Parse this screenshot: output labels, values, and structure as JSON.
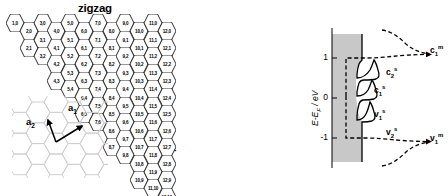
{
  "figure": {
    "left_panel": {
      "zigzag_label": "zigzag",
      "armchair_label": "armchair",
      "lattice_vectors": [
        {
          "name": "a1",
          "base": "a",
          "sub": "1"
        },
        {
          "name": "a2",
          "base": "a",
          "sub": "2"
        }
      ],
      "hexagons": [
        {
          "n": 1,
          "m": 0,
          "label": "1,0",
          "col": 1,
          "row": 0
        },
        {
          "n": 2,
          "m": 0,
          "label": "2,0",
          "col": 2,
          "row": 0
        },
        {
          "n": 3,
          "m": 0,
          "label": "3,0",
          "col": 3,
          "row": 0
        },
        {
          "n": 4,
          "m": 0,
          "label": "4,0",
          "col": 4,
          "row": 0
        },
        {
          "n": 5,
          "m": 0,
          "label": "5,0",
          "col": 5,
          "row": 0
        },
        {
          "n": 6,
          "m": 0,
          "label": "6,0",
          "col": 6,
          "row": 0
        },
        {
          "n": 7,
          "m": 0,
          "label": "7,0",
          "col": 7,
          "row": 0
        },
        {
          "n": 8,
          "m": 0,
          "label": "8,0",
          "col": 8,
          "row": 0
        },
        {
          "n": 9,
          "m": 0,
          "label": "9,0",
          "col": 9,
          "row": 0
        },
        {
          "n": 10,
          "m": 0,
          "label": "10,0",
          "col": 10,
          "row": 0
        },
        {
          "n": 11,
          "m": 0,
          "label": "11,0",
          "col": 11,
          "row": 0
        },
        {
          "n": 12,
          "m": 0,
          "label": "12,0",
          "col": 12,
          "row": 0
        },
        {
          "n": 2,
          "m": 1,
          "label": "2,1",
          "col": 2,
          "row": 1
        },
        {
          "n": 3,
          "m": 1,
          "label": "3,1",
          "col": 3,
          "row": 1
        },
        {
          "n": 4,
          "m": 1,
          "label": "4,1",
          "col": 4,
          "row": 1
        },
        {
          "n": 5,
          "m": 1,
          "label": "5,1",
          "col": 5,
          "row": 1
        },
        {
          "n": 6,
          "m": 1,
          "label": "6,1",
          "col": 6,
          "row": 1
        },
        {
          "n": 7,
          "m": 1,
          "label": "7,1",
          "col": 7,
          "row": 1
        },
        {
          "n": 8,
          "m": 1,
          "label": "8,1",
          "col": 8,
          "row": 1
        },
        {
          "n": 9,
          "m": 1,
          "label": "9,1",
          "col": 9,
          "row": 1
        },
        {
          "n": 10,
          "m": 1,
          "label": "10,1",
          "col": 10,
          "row": 1
        },
        {
          "n": 11,
          "m": 1,
          "label": "11,1",
          "col": 11,
          "row": 1
        },
        {
          "n": 12,
          "m": 1,
          "label": "12,1",
          "col": 12,
          "row": 1
        },
        {
          "n": 3,
          "m": 2,
          "label": "3,2",
          "col": 3,
          "row": 2
        },
        {
          "n": 4,
          "m": 2,
          "label": "4,2",
          "col": 4,
          "row": 2
        },
        {
          "n": 5,
          "m": 2,
          "label": "5,2",
          "col": 5,
          "row": 2
        },
        {
          "n": 6,
          "m": 2,
          "label": "6,2",
          "col": 6,
          "row": 2
        },
        {
          "n": 7,
          "m": 2,
          "label": "7,2",
          "col": 7,
          "row": 2
        },
        {
          "n": 8,
          "m": 2,
          "label": "8,2",
          "col": 8,
          "row": 2
        },
        {
          "n": 9,
          "m": 2,
          "label": "9,2",
          "col": 9,
          "row": 2
        },
        {
          "n": 10,
          "m": 2,
          "label": "10,2",
          "col": 10,
          "row": 2
        },
        {
          "n": 11,
          "m": 2,
          "label": "11,2",
          "col": 11,
          "row": 2
        },
        {
          "n": 12,
          "m": 2,
          "label": "12,2",
          "col": 12,
          "row": 2
        },
        {
          "n": 4,
          "m": 3,
          "label": "4,3",
          "col": 4,
          "row": 3
        },
        {
          "n": 5,
          "m": 3,
          "label": "5,3",
          "col": 5,
          "row": 3
        },
        {
          "n": 6,
          "m": 3,
          "label": "6,3",
          "col": 6,
          "row": 3
        },
        {
          "n": 7,
          "m": 3,
          "label": "7,3",
          "col": 7,
          "row": 3
        },
        {
          "n": 8,
          "m": 3,
          "label": "8,3",
          "col": 8,
          "row": 3
        },
        {
          "n": 9,
          "m": 3,
          "label": "9,3",
          "col": 9,
          "row": 3
        },
        {
          "n": 10,
          "m": 3,
          "label": "10,3",
          "col": 10,
          "row": 3
        },
        {
          "n": 11,
          "m": 3,
          "label": "11,3",
          "col": 11,
          "row": 3
        },
        {
          "n": 12,
          "m": 3,
          "label": "12,3",
          "col": 12,
          "row": 3
        },
        {
          "n": 5,
          "m": 4,
          "label": "5,4",
          "col": 5,
          "row": 4
        },
        {
          "n": 6,
          "m": 4,
          "label": "6,4",
          "col": 6,
          "row": 4
        },
        {
          "n": 7,
          "m": 4,
          "label": "7,4",
          "col": 7,
          "row": 4
        },
        {
          "n": 8,
          "m": 4,
          "label": "8,4",
          "col": 8,
          "row": 4
        },
        {
          "n": 9,
          "m": 4,
          "label": "9,4",
          "col": 9,
          "row": 4
        },
        {
          "n": 10,
          "m": 4,
          "label": "10,4",
          "col": 10,
          "row": 4
        },
        {
          "n": 11,
          "m": 4,
          "label": "11,4",
          "col": 11,
          "row": 4
        },
        {
          "n": 12,
          "m": 4,
          "label": "12,4",
          "col": 12,
          "row": 4
        },
        {
          "n": 6,
          "m": 5,
          "label": "6,5",
          "col": 6,
          "row": 5
        },
        {
          "n": 7,
          "m": 5,
          "label": "7,5",
          "col": 7,
          "row": 5
        },
        {
          "n": 8,
          "m": 5,
          "label": "8,5",
          "col": 8,
          "row": 5
        },
        {
          "n": 9,
          "m": 5,
          "label": "9,5",
          "col": 9,
          "row": 5
        },
        {
          "n": 10,
          "m": 5,
          "label": "10,5",
          "col": 10,
          "row": 5
        },
        {
          "n": 11,
          "m": 5,
          "label": "11,5",
          "col": 11,
          "row": 5
        },
        {
          "n": 12,
          "m": 5,
          "label": "12,5",
          "col": 12,
          "row": 5
        },
        {
          "n": 7,
          "m": 6,
          "label": "7,6",
          "col": 7,
          "row": 6
        },
        {
          "n": 8,
          "m": 6,
          "label": "8,6",
          "col": 8,
          "row": 6
        },
        {
          "n": 9,
          "m": 6,
          "label": "9,6",
          "col": 9,
          "row": 6
        },
        {
          "n": 10,
          "m": 6,
          "label": "10,6",
          "col": 10,
          "row": 6
        },
        {
          "n": 11,
          "m": 6,
          "label": "11,6",
          "col": 11,
          "row": 6
        },
        {
          "n": 12,
          "m": 6,
          "label": "12,6",
          "col": 12,
          "row": 6
        },
        {
          "n": 8,
          "m": 7,
          "label": "8,7",
          "col": 8,
          "row": 7
        },
        {
          "n": 9,
          "m": 7,
          "label": "9,7",
          "col": 9,
          "row": 7
        },
        {
          "n": 10,
          "m": 7,
          "label": "10,7",
          "col": 10,
          "row": 7
        },
        {
          "n": 11,
          "m": 7,
          "label": "11,7",
          "col": 11,
          "row": 7
        },
        {
          "n": 12,
          "m": 7,
          "label": "12,7",
          "col": 12,
          "row": 7
        },
        {
          "n": 9,
          "m": 8,
          "label": "9,8",
          "col": 9,
          "row": 8
        },
        {
          "n": 10,
          "m": 8,
          "label": "10,8",
          "col": 10,
          "row": 8
        },
        {
          "n": 11,
          "m": 8,
          "label": "11,8",
          "col": 11,
          "row": 8
        },
        {
          "n": 12,
          "m": 8,
          "label": "12,8",
          "col": 12,
          "row": 8
        },
        {
          "n": 10,
          "m": 9,
          "label": "10,9",
          "col": 10,
          "row": 9
        },
        {
          "n": 11,
          "m": 9,
          "label": "11,9",
          "col": 11,
          "row": 9
        },
        {
          "n": 12,
          "m": 9,
          "label": "12,9",
          "col": 12,
          "row": 9
        },
        {
          "n": 11,
          "m": 10,
          "label": "11,10",
          "col": 11,
          "row": 10
        },
        {
          "n": 12,
          "m": 10,
          "label": "12,10",
          "col": 12,
          "row": 10
        }
      ]
    },
    "right_panel": {
      "y_axis_title_main": "E-E",
      "y_axis_title_sub": "F",
      "y_axis_title_unit": " / eV",
      "y_ticks": [
        "1",
        "0",
        "-1"
      ],
      "peak_labels": [
        {
          "id": "c1m",
          "base": "c",
          "sub": "1",
          "sup": "m"
        },
        {
          "id": "c2s",
          "base": "c",
          "sub": "2",
          "sup": "s"
        },
        {
          "id": "c1s",
          "base": "c",
          "sub": "1",
          "sup": "s"
        },
        {
          "id": "v1s",
          "base": "v",
          "sub": "1",
          "sup": "s"
        },
        {
          "id": "v2s",
          "base": "v",
          "sub": "2",
          "sup": "s"
        },
        {
          "id": "v1m",
          "base": "v",
          "sub": "1",
          "sup": "m"
        }
      ]
    }
  },
  "chart_data": {
    "type": "line",
    "xlabel": "DOS (arb. units)",
    "ylabel": "E-E_F / eV",
    "ylim": [
      -1.45,
      1.45
    ],
    "xlim": [
      0,
      1
    ],
    "grid": false,
    "legend_position": "inline-annotations",
    "yticks": [
      1,
      0,
      -1
    ],
    "series": [
      {
        "name": "semiconducting DOS (solid)",
        "style": "solid",
        "color": "#000000",
        "van_hove_peaks": [
          {
            "label": "c2s",
            "energy": 0.72,
            "branch": "conduction",
            "index": 2
          },
          {
            "label": "c1s",
            "energy": 0.36,
            "branch": "conduction",
            "index": 1
          },
          {
            "label": "v1s",
            "energy": -0.36,
            "branch": "valence",
            "index": 1
          },
          {
            "label": "v2s",
            "energy": -0.72,
            "branch": "valence",
            "index": 2
          }
        ],
        "band_gap_eV": 0.72
      },
      {
        "name": "metallic DOS (dashed)",
        "style": "dashed",
        "color": "#000000",
        "van_hove_peaks": [
          {
            "label": "c1m",
            "energy": 1.0,
            "branch": "conduction",
            "index": 1
          },
          {
            "label": "v1m",
            "energy": -1.0,
            "branch": "valence",
            "index": 1
          }
        ],
        "band_gap_eV": 0.0
      },
      {
        "name": "filled valence/continuum shading",
        "style": "filled-area",
        "color": "#c8c8c8"
      }
    ]
  }
}
